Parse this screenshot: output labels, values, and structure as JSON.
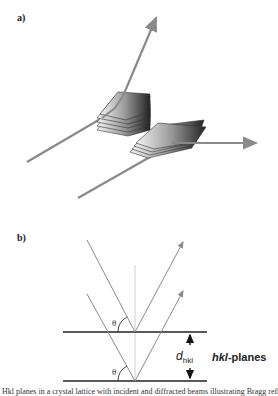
{
  "panels": {
    "a": {
      "label": "a)"
    },
    "b": {
      "label": "b)",
      "angle_symbol": "θ",
      "spacing_symbol": "d",
      "spacing_subscript": "hkl",
      "planes_label_italic": "hkl",
      "planes_label_rest": "-planes"
    }
  },
  "colors": {
    "beam": "#8a8a8a",
    "plane_line": "#222222",
    "arrow": "#111111"
  },
  "caption": "Hkl planes in a crystal lattice with incident and diffracted beams illustrating Bragg reflection"
}
